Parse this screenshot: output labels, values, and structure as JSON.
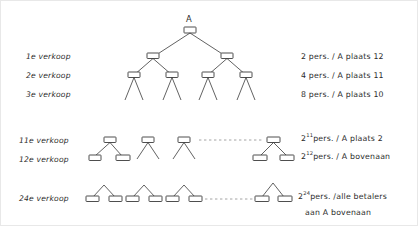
{
  "diagram": {
    "root_label": "A",
    "rows": {
      "left_labels": [
        {
          "id": "row-1",
          "text": "1e verkoop"
        },
        {
          "id": "row-2",
          "text": "2e verkoop"
        },
        {
          "id": "row-3",
          "text": "3e verkoop"
        },
        {
          "id": "row-11",
          "text": "11e verkoop"
        },
        {
          "id": "row-12",
          "text": "12e verkoop"
        },
        {
          "id": "row-24",
          "text": "24e verkoop"
        }
      ],
      "right_labels": [
        {
          "id": "note-1",
          "text": "2 pers. / A plaats 12"
        },
        {
          "id": "note-2",
          "text": "4 pers. / A plaats 11"
        },
        {
          "id": "note-3",
          "text": "8 pers. / A plaats 10"
        },
        {
          "id": "note-11",
          "base": "2",
          "exponent": "11",
          "text": "pers. / A plaats  2"
        },
        {
          "id": "note-12",
          "base": "2",
          "exponent": "12",
          "text": "pers. / A bovenaan"
        },
        {
          "id": "note-24",
          "base": "2",
          "exponent": "24",
          "text": "pers. /alle betalers"
        },
        {
          "id": "note-24b",
          "text": "aan A bovenaan"
        }
      ]
    },
    "ellipsis": {
      "middle_row": "dashed-continuation",
      "bottom_row": "dashed-continuation"
    }
  }
}
